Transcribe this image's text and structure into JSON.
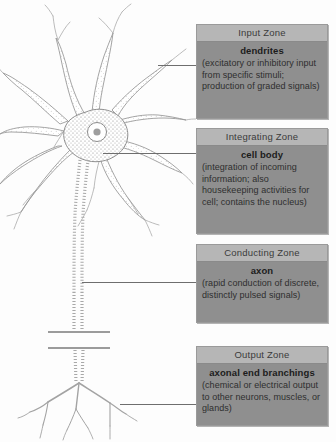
{
  "figure": {
    "background_color": "#fdfdfd",
    "box_fill_color": "#8f8f8f",
    "box_header_color": "#b6b6b6",
    "leader_line_color": "#6e6e6e",
    "illustration_ink_color": "#8a8a8a"
  },
  "illustration": {
    "name": "stippled neuron drawing",
    "parts": [
      {
        "name": "dendrites",
        "label": "dendrites"
      },
      {
        "name": "cell-body",
        "label": "cell body"
      },
      {
        "name": "nucleus",
        "label": "nucleus"
      },
      {
        "name": "axon",
        "label": "axon"
      },
      {
        "name": "axon-break",
        "label": "axon break marks"
      },
      {
        "name": "axonal-end-branchings",
        "label": "axonal end branchings"
      }
    ]
  },
  "zones": [
    {
      "id": "input",
      "header": "Input Zone",
      "term": "dendrites",
      "description": "(excitatory or inhibitory input from specific stimuli; production of graded signals)"
    },
    {
      "id": "integrating",
      "header": "Integrating Zone",
      "term": "cell body",
      "description": "(integration of incoming information; also housekeeping activities for cell; contains the nucleus)"
    },
    {
      "id": "conducting",
      "header": "Conducting Zone",
      "term": "axon",
      "description": "(rapid conduction of discrete, distinctly pulsed signals)"
    },
    {
      "id": "output",
      "header": "Output Zone",
      "term": "axonal end branchings",
      "description": "(chemical or electrical output to other neurons, muscles, or glands)"
    }
  ]
}
